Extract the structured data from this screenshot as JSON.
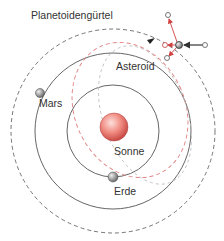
{
  "labels": {
    "belt": "Planetoidengürtel",
    "asteroid": "Asteroid",
    "mars": "Mars",
    "sun": "Sonne",
    "earth": "Erde"
  },
  "colors": {
    "orbit": "#555555",
    "belt": "#666666",
    "trajectory": "#e08080",
    "sun": "#e87070",
    "planet": "#888888",
    "vector_red": "#d04040",
    "vector_dark": "#333333"
  }
}
